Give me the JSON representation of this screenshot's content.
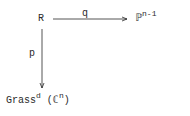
{
  "diagram": {
    "nodes": {
      "R": {
        "text": "R"
      },
      "P": {
        "base": "ℙ",
        "sup": "n-1"
      },
      "G": {
        "base": "Grass",
        "sup": "d",
        "open": " (",
        "field": "ℂ",
        "field_sup": "n",
        "close": ")"
      }
    },
    "arrows": {
      "q": {
        "label": "q",
        "from": "R",
        "to": "ℙ^{n-1}",
        "direction": "horizontal"
      },
      "p": {
        "label": "p",
        "from": "R",
        "to": "Grass^d(ℂ^n)",
        "direction": "vertical"
      }
    },
    "colors": {
      "ink": "#2a2a2a",
      "background": "#ffffff"
    }
  }
}
